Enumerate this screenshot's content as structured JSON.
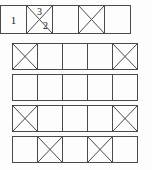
{
  "figure": {
    "style": {
      "line_color": "#4a4a4a",
      "text_color": "#1a1a1a",
      "background": "#ffffff"
    },
    "rows": [
      {
        "name": "row-1",
        "left": 0,
        "top": 5,
        "cell_width": 27,
        "cell_height": 29,
        "cells": [
          {
            "name": "cell-1-1",
            "diagonals": [],
            "labels": [
              {
                "text": "1",
                "pos": "center"
              }
            ]
          },
          {
            "name": "cell-1-2",
            "diagonals": [
              "tl-br",
              "bl-tr"
            ],
            "labels": [
              {
                "text": "3",
                "pos": "top"
              },
              {
                "text": "2",
                "pos": "lowerright"
              }
            ]
          },
          {
            "name": "cell-1-3",
            "diagonals": [],
            "labels": []
          },
          {
            "name": "cell-1-4",
            "diagonals": [
              "tl-br",
              "bl-tr"
            ],
            "labels": []
          },
          {
            "name": "cell-1-5",
            "diagonals": [],
            "labels": []
          }
        ]
      },
      {
        "name": "row-2",
        "left": 12,
        "top": 43,
        "cell_width": 26,
        "cell_height": 27,
        "cells": [
          {
            "name": "cell-2-1",
            "diagonals": [
              "tl-br",
              "bl-tr"
            ],
            "labels": []
          },
          {
            "name": "cell-2-2",
            "diagonals": [],
            "labels": []
          },
          {
            "name": "cell-2-3",
            "diagonals": [],
            "labels": []
          },
          {
            "name": "cell-2-4",
            "diagonals": [],
            "labels": []
          },
          {
            "name": "cell-2-5",
            "diagonals": [
              "tl-br",
              "bl-tr"
            ],
            "labels": []
          }
        ]
      },
      {
        "name": "row-3",
        "left": 12,
        "top": 74,
        "cell_width": 26,
        "cell_height": 27,
        "cells": [
          {
            "name": "cell-3-1",
            "diagonals": [],
            "labels": []
          },
          {
            "name": "cell-3-2",
            "diagonals": [],
            "labels": []
          },
          {
            "name": "cell-3-3",
            "diagonals": [],
            "labels": []
          },
          {
            "name": "cell-3-4",
            "diagonals": [],
            "labels": []
          },
          {
            "name": "cell-3-5",
            "diagonals": [],
            "labels": []
          }
        ]
      },
      {
        "name": "row-4",
        "left": 12,
        "top": 105,
        "cell_width": 26,
        "cell_height": 27,
        "cells": [
          {
            "name": "cell-4-1",
            "diagonals": [
              "tl-br",
              "bl-tr"
            ],
            "labels": []
          },
          {
            "name": "cell-4-2",
            "diagonals": [],
            "labels": []
          },
          {
            "name": "cell-4-3",
            "diagonals": [],
            "labels": []
          },
          {
            "name": "cell-4-4",
            "diagonals": [],
            "labels": []
          },
          {
            "name": "cell-4-5",
            "diagonals": [
              "tl-br",
              "bl-tr"
            ],
            "labels": []
          }
        ]
      },
      {
        "name": "row-5",
        "left": 12,
        "top": 136,
        "cell_width": 26,
        "cell_height": 27,
        "cells": [
          {
            "name": "cell-5-1",
            "diagonals": [],
            "labels": []
          },
          {
            "name": "cell-5-2",
            "diagonals": [
              "tl-br",
              "bl-tr"
            ],
            "labels": []
          },
          {
            "name": "cell-5-3",
            "diagonals": [],
            "labels": []
          },
          {
            "name": "cell-5-4",
            "diagonals": [
              "tl-br",
              "bl-tr"
            ],
            "labels": []
          },
          {
            "name": "cell-5-5",
            "diagonals": [],
            "labels": []
          }
        ]
      }
    ]
  }
}
